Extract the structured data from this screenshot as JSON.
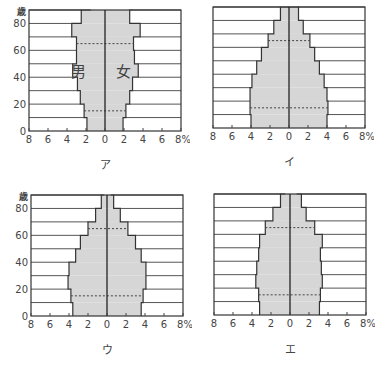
{
  "chart_data": [
    {
      "type": "bar",
      "subtype": "population-pyramid",
      "title": "ア",
      "ylabel": "歳",
      "xlabel": "%",
      "age_groups": [
        "0-9",
        "10-19",
        "20-29",
        "30-39",
        "40-49",
        "50-59",
        "60-69",
        "70-79",
        "80-89",
        "90+"
      ],
      "y_ticks": [
        0,
        20,
        40,
        60,
        80
      ],
      "x_ticks": [
        "8",
        "6",
        "4",
        "2",
        "0",
        "2",
        "4",
        "6",
        "8%"
      ],
      "xlim": [
        -8,
        8
      ],
      "annotations": [
        "男",
        "女"
      ],
      "series": [
        {
          "name": "男",
          "values": [
            1.9,
            2.2,
            2.6,
            2.9,
            3.4,
            3.0,
            3.0,
            3.5,
            2.5,
            1.5
          ]
        },
        {
          "name": "女",
          "values": [
            1.9,
            2.2,
            2.6,
            2.9,
            3.5,
            3.1,
            3.0,
            3.7,
            2.6,
            3.0
          ]
        }
      ],
      "dotted_lines_at_age": [
        15,
        65
      ]
    },
    {
      "type": "bar",
      "subtype": "population-pyramid",
      "title": "イ",
      "age_groups": [
        "0-9",
        "10-19",
        "20-29",
        "30-39",
        "40-49",
        "50-59",
        "60-69",
        "70-79",
        "80-89",
        "90+"
      ],
      "x_ticks": [
        "8",
        "6",
        "4",
        "2",
        "0",
        "2",
        "4",
        "6",
        "8%"
      ],
      "xlim": [
        -8,
        8
      ],
      "series": [
        {
          "name": "男",
          "values": [
            4.0,
            4.1,
            4.1,
            3.9,
            3.4,
            2.9,
            2.2,
            1.6,
            0.9,
            0
          ]
        },
        {
          "name": "女",
          "values": [
            4.0,
            4.1,
            4.0,
            3.7,
            3.2,
            2.7,
            2.2,
            1.5,
            1.0,
            0
          ]
        }
      ],
      "dotted_lines_at_age": [
        15,
        65
      ]
    },
    {
      "type": "bar",
      "subtype": "population-pyramid",
      "title": "ウ",
      "ylabel": "歳",
      "y_ticks": [
        0,
        20,
        40,
        60,
        80
      ],
      "age_groups": [
        "0-9",
        "10-19",
        "20-29",
        "30-39",
        "40-49",
        "50-59",
        "60-69",
        "70-79",
        "80-89",
        "90+"
      ],
      "x_ticks": [
        "8",
        "6",
        "4",
        "2",
        "0",
        "2",
        "4",
        "6",
        "8%"
      ],
      "xlim": [
        -8,
        8
      ],
      "series": [
        {
          "name": "男",
          "values": [
            3.6,
            3.8,
            4.1,
            4.0,
            3.3,
            2.8,
            2.0,
            1.2,
            0.6,
            0.3
          ]
        },
        {
          "name": "女",
          "values": [
            3.6,
            3.8,
            4.1,
            4.1,
            3.6,
            3.0,
            2.2,
            1.4,
            0.7,
            0.4
          ]
        }
      ],
      "dotted_lines_at_age": [
        15,
        65
      ]
    },
    {
      "type": "bar",
      "subtype": "population-pyramid",
      "title": "エ",
      "age_groups": [
        "0-9",
        "10-19",
        "20-29",
        "30-39",
        "40-49",
        "50-59",
        "60-69",
        "70-79",
        "80-89",
        "90+"
      ],
      "x_ticks": [
        "8",
        "6",
        "4",
        "2",
        "0",
        "2",
        "4",
        "6",
        "8%"
      ],
      "xlim": [
        -8,
        8
      ],
      "series": [
        {
          "name": "男",
          "values": [
            3.2,
            3.3,
            3.6,
            3.5,
            3.3,
            3.2,
            2.6,
            1.8,
            1.0,
            0.5
          ]
        },
        {
          "name": "女",
          "values": [
            3.1,
            3.2,
            3.4,
            3.3,
            3.2,
            3.4,
            2.6,
            1.7,
            1.2,
            0.7
          ]
        }
      ],
      "dotted_lines_at_age": [
        15,
        65
      ]
    }
  ],
  "panels": [
    {
      "label": "ア",
      "x": 29,
      "y": 10,
      "show_y_axis": true,
      "male_label": "男",
      "female_label": "女"
    },
    {
      "label": "イ",
      "x": 213,
      "y": 7,
      "show_y_axis": false
    },
    {
      "label": "ウ",
      "x": 31,
      "y": 195,
      "show_y_axis": true
    },
    {
      "label": "エ",
      "x": 214,
      "y": 194,
      "show_y_axis": false
    }
  ],
  "axis": {
    "age_unit": "歳",
    "y_tick_labels": [
      "0",
      "20",
      "40",
      "60",
      "80"
    ],
    "x_tick_labels": [
      "8",
      "6",
      "4",
      "2",
      "0",
      "2",
      "4",
      "6",
      "8%"
    ]
  },
  "colors": {
    "fill": "#d6d6d6",
    "line": "#333333",
    "grid": "#555555"
  }
}
